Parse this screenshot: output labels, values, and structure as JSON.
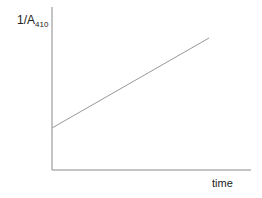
{
  "chart_data": {
    "type": "line",
    "title": "",
    "xlabel": "time",
    "ylabel": "1/A",
    "ylabel_subscript": "410",
    "grid": false,
    "ticks": false,
    "series": [
      {
        "name": "1/A410 vs time",
        "x": [
          0,
          1
        ],
        "values": [
          0.28,
          0.88
        ],
        "color": "#999999"
      }
    ],
    "xlim": [
      0,
      1
    ],
    "ylim": [
      0,
      1
    ]
  },
  "axes": {
    "color": "#8a8a8a"
  }
}
